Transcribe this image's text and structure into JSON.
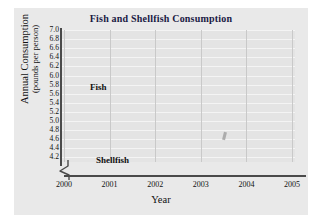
{
  "chart_data": {
    "type": "line",
    "title": "Fish and Shellfish Consumption",
    "xlabel": "Year",
    "ylabel": "Annual Consumption",
    "ylabel_sub": "(pounds per person)",
    "categories": [
      "2000",
      "2001",
      "2002",
      "2003",
      "2004",
      "2005"
    ],
    "x": [
      2000,
      2001,
      2002,
      2003,
      2004,
      2005
    ],
    "series": [
      {
        "name": "Fish",
        "values": [
          5.6,
          5.7,
          6.0,
          5.7,
          5.55,
          5.6
        ],
        "color": "#1a1a1a"
      },
      {
        "name": "Shellfish",
        "values": [
          4.6,
          4.6,
          5.0,
          5.7,
          6.3,
          6.2
        ],
        "color": "#1a1a1a"
      }
    ],
    "ylim": [
      4.1,
      7.0
    ],
    "ytick_start": 4.2,
    "ytick_end": 7.0,
    "ytick_step": 0.2,
    "yticks": [
      "7.0",
      "6.8",
      "6.6",
      "6.4",
      "6.2",
      "6.0",
      "5.8",
      "5.6",
      "5.4",
      "5.2",
      "5.0",
      "4.8",
      "4.6",
      "4.4",
      "4.2"
    ],
    "grid": true,
    "grid_horizontal": true,
    "grid_vertical": true,
    "legend_position": "inline-annotations",
    "axis_break": true,
    "marker": "filled-circle",
    "background_color": "#e9e9e9",
    "plot_background_color": "#e4e4e4",
    "title_color": "#1a1a44",
    "line_color": "#1a1a1a"
  },
  "annotations": {
    "fish_label": "Fish",
    "shellfish_label": "Shellfish"
  }
}
